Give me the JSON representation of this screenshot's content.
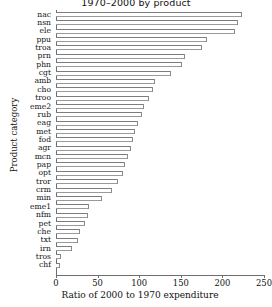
{
  "chart_data": {
    "type": "bar",
    "orientation": "horizontal",
    "title": "1970–2000 by product",
    "xlabel": "Ratio of 2000 to 1970 expenditure",
    "ylabel": "Product category",
    "xlim": [
      0,
      250
    ],
    "xticks": [
      0,
      50,
      100,
      150,
      200,
      250
    ],
    "grid": false,
    "legend": null,
    "categories": [
      "nac",
      "nsn",
      "ele",
      "ppu",
      "troa",
      "prn",
      "phn",
      "cgt",
      "amb",
      "cho",
      "troo",
      "eme2",
      "rub",
      "eag",
      "met",
      "fod",
      "agr",
      "mcn",
      "pap",
      "opt",
      "tror",
      "crm",
      "min",
      "eme1",
      "nfm",
      "pet",
      "che",
      "txt",
      "irn",
      "tros",
      "chf"
    ],
    "values": [
      223,
      219,
      215,
      182,
      176,
      155,
      152,
      138,
      119,
      117,
      112,
      106,
      103,
      98,
      95,
      92,
      90,
      87,
      83,
      81,
      75,
      67,
      55,
      40,
      38,
      35,
      29,
      27,
      19,
      6,
      5
    ]
  },
  "axes": {
    "x_tick_labels": [
      "0",
      "50",
      "100",
      "150",
      "200",
      "250"
    ]
  }
}
